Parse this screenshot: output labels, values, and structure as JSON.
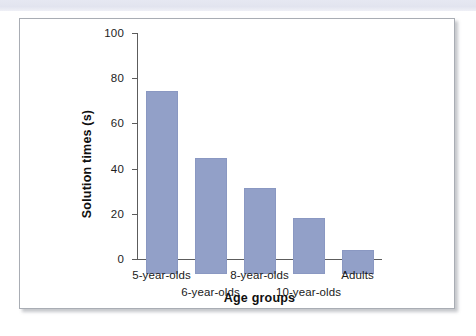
{
  "figure": {
    "background_color": "#ffffff",
    "panel_border_color": "#a9adb4",
    "top_strip_color": "#e3e5f0",
    "bar_color": "#92a0c8",
    "axis_color": "#5c5c5c"
  },
  "chart_data": {
    "type": "bar",
    "title": "",
    "xlabel": "Age groups",
    "ylabel": "Solution times (s)",
    "categories": [
      "5-year-olds",
      "6-year-olds",
      "8-year-olds",
      "10-year-olds",
      "Adults"
    ],
    "values": [
      81,
      51.5,
      38,
      25,
      10.5
    ],
    "ylim": [
      0,
      100
    ],
    "yticks": [
      0,
      20,
      40,
      60,
      80,
      100
    ],
    "ytick_labels": [
      "0",
      "20",
      "40",
      "60",
      "80",
      "100"
    ],
    "xtick_labels": [
      "5-year-olds",
      "6-year-olds",
      "8-year-olds",
      "10-year-olds",
      "Adults"
    ],
    "xtick_label_rows": [
      0,
      1,
      0,
      1,
      0
    ],
    "grid": false,
    "legend": null,
    "series": [
      {
        "name": "Solution times",
        "values": [
          81,
          51.5,
          38,
          25,
          10.5
        ],
        "color": "#92a0c8"
      }
    ],
    "annotations": []
  }
}
